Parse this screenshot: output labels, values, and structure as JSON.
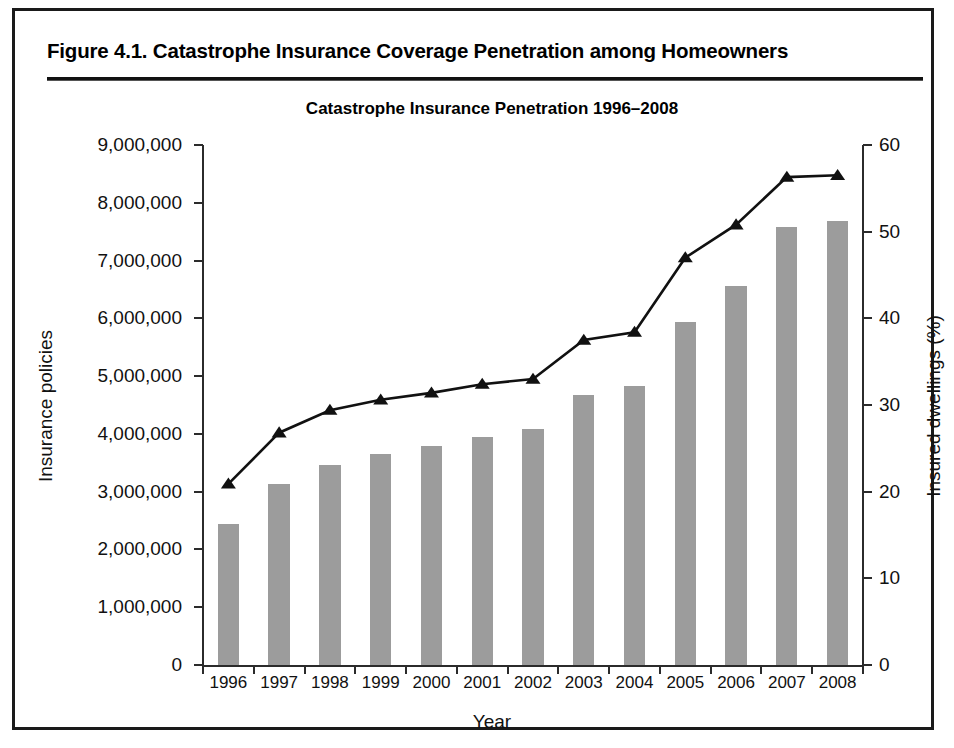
{
  "figure": {
    "caption": "Figure 4.1. Catastrophe Insurance Coverage Penetration among Homeowners"
  },
  "chart_data": {
    "type": "bar",
    "title": "Catastrophe Insurance Penetration 1996–2008",
    "xlabel": "Year",
    "ylabel": "Insurance policies",
    "ylabel_right": "Insured dwellings (%)",
    "categories": [
      "1996",
      "1997",
      "1998",
      "1999",
      "2000",
      "2001",
      "2002",
      "2003",
      "2004",
      "2005",
      "2006",
      "2007",
      "2008"
    ],
    "ylim": [
      0,
      9000000
    ],
    "ylim_right": [
      0,
      60
    ],
    "ytick_labels": [
      "9,000,000",
      "8,000,000",
      "7,000,000",
      "6,000,000",
      "5,000,000",
      "4,000,000",
      "3,000,000",
      "2,000,000",
      "1,000,000",
      "0"
    ],
    "ytick_values": [
      9000000,
      8000000,
      7000000,
      6000000,
      5000000,
      4000000,
      3000000,
      2000000,
      1000000,
      0
    ],
    "ytick_right_labels": [
      "60",
      "50",
      "40",
      "30",
      "20",
      "10",
      "0"
    ],
    "ytick_right_values": [
      60,
      50,
      40,
      30,
      20,
      10,
      0
    ],
    "grid": false,
    "legend": "none",
    "series": [
      {
        "name": "Insurance policies",
        "type": "bar",
        "axis": "left",
        "color": "#9c9c9c",
        "values": [
          2440000,
          3130000,
          3470000,
          3660000,
          3790000,
          3950000,
          4080000,
          4680000,
          4830000,
          5940000,
          6560000,
          7580000,
          7680000
        ]
      },
      {
        "name": "Insured dwellings (%)",
        "type": "line",
        "axis": "right",
        "color": "#111111",
        "marker": "triangle",
        "values": [
          20.9,
          26.8,
          29.4,
          30.6,
          31.4,
          32.4,
          33.0,
          37.5,
          38.4,
          47.0,
          50.8,
          56.3,
          56.5
        ]
      }
    ]
  }
}
